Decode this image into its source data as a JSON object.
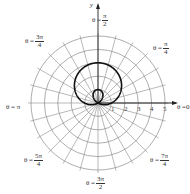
{
  "chart_data": {
    "type": "line",
    "coordinate_system": "polar",
    "title": "",
    "equation_implied": "r = 1 + 2 sin(theta)",
    "curve": "limacon with inner loop",
    "polar_grid": {
      "rings": [
        1,
        2,
        3,
        4,
        5
      ],
      "radial_lines_every_rad": 0.2618,
      "radial_lines_count": 24
    },
    "radial_tick_labels": [
      "1",
      "2",
      "3",
      "4",
      "5"
    ],
    "angle_labels": [
      {
        "id": "a0",
        "prefix": "θ = ",
        "num": "",
        "den": "",
        "text": "0"
      },
      {
        "id": "a1",
        "prefix": "θ = ",
        "num": "π",
        "den": "4"
      },
      {
        "id": "a2",
        "prefix": "θ = ",
        "num": "π",
        "den": "2"
      },
      {
        "id": "a3",
        "prefix": "θ = ",
        "num": "3π",
        "den": "4"
      },
      {
        "id": "a4",
        "prefix": "θ = ",
        "num": "",
        "den": "",
        "text": "π"
      },
      {
        "id": "a5",
        "prefix": "θ = ",
        "num": "5π",
        "den": "4"
      },
      {
        "id": "a6",
        "prefix": "θ = ",
        "num": "3π",
        "den": "2"
      },
      {
        "id": "a7",
        "prefix": "θ = ",
        "num": "7π",
        "den": "4"
      }
    ],
    "x_axis_label": "",
    "y_axis_label": "y",
    "points_sampled": {
      "theta_deg": [
        0,
        30,
        60,
        90,
        120,
        150,
        180,
        210,
        240,
        270,
        300,
        330,
        360
      ],
      "r": [
        1,
        2,
        2.73,
        3,
        2.73,
        2,
        1,
        0,
        -0.73,
        -1,
        -0.73,
        0,
        1
      ]
    },
    "rmax": 5,
    "grid": true,
    "legend": null
  },
  "labels": {
    "theta_0_prefix": "θ = ",
    "theta_0_value": "0",
    "theta_pi": "θ = π",
    "theta_pi2_prefix": "θ = ",
    "theta_pi2_num": "π",
    "theta_pi2_den": "2",
    "theta_pi4_prefix": "θ = ",
    "theta_pi4_num": "π",
    "theta_pi4_den": "4",
    "theta_3pi4_prefix": "θ = ",
    "theta_3pi4_num": "3π",
    "theta_3pi4_den": "4",
    "theta_5pi4_prefix": "θ = ",
    "theta_5pi4_num": "5π",
    "theta_5pi4_den": "4",
    "theta_3pi2_prefix": "θ = ",
    "theta_3pi2_num": "3π",
    "theta_3pi2_den": "2",
    "theta_7pi4_prefix": "θ = ",
    "theta_7pi4_num": "7π",
    "theta_7pi4_den": "4",
    "y_axis": "y",
    "ticks": [
      "1",
      "2",
      "3",
      "4",
      "5"
    ]
  },
  "colors": {
    "grid": "#8a8a8a",
    "curve": "#111111",
    "axis": "#222222"
  }
}
